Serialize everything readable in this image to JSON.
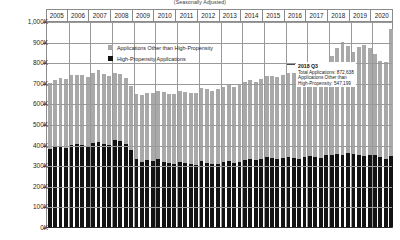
{
  "chart": {
    "subtitle": "(Seasonally Adjusted)",
    "type": "bar"
  },
  "legend": {
    "position": "inside-top-left",
    "items": [
      {
        "label": "Applications Other than High-Propensity",
        "color": "#a9a9a9",
        "swatch_name": "legend-swatch-other"
      },
      {
        "label": "High-Propensity Applications",
        "color": "#131313",
        "swatch_name": "legend-swatch-high"
      }
    ]
  },
  "annotation": {
    "header": "2018 Q3",
    "line1": "Total Applications: 872,638",
    "line2": "Applications Other than",
    "line3": "High-Propensity: 547,199"
  },
  "chart_data": {
    "type": "bar",
    "stacked": true,
    "title": "",
    "subtitle": "(Seasonally Adjusted)",
    "xlabel": "",
    "ylabel": "",
    "ylim": [
      0,
      1000000
    ],
    "grid": true,
    "ytick_labels": [
      "1,000K",
      "900K",
      "800K",
      "700K",
      "600K",
      "500K",
      "400K",
      "300K",
      "200K",
      "100K",
      "0K"
    ],
    "ytick_values": [
      1000000,
      900000,
      800000,
      700000,
      600000,
      500000,
      400000,
      300000,
      200000,
      100000,
      0
    ],
    "year_labels": [
      "2005",
      "2006",
      "2007",
      "2008",
      "2009",
      "2010",
      "2011",
      "2012",
      "2013",
      "2014",
      "2015",
      "2016",
      "2017",
      "2018",
      "2019",
      "2020"
    ],
    "x_unit": "quarter",
    "series": [
      {
        "name": "High-Propensity Applications",
        "color": "#131313",
        "values": [
          380000,
          388000,
          392000,
          385000,
          398000,
          404000,
          399000,
          392000,
          408000,
          414000,
          405000,
          396000,
          420000,
          418000,
          404000,
          372000,
          330000,
          318000,
          324000,
          320000,
          328000,
          316000,
          310000,
          306000,
          318000,
          312000,
          306000,
          300000,
          322000,
          310000,
          304000,
          308000,
          316000,
          320000,
          312000,
          318000,
          326000,
          330000,
          324000,
          330000,
          338000,
          334000,
          330000,
          336000,
          340000,
          336000,
          330000,
          340000,
          344000,
          342000,
          336000,
          348000,
          352000,
          356000,
          350000,
          358000,
          354000,
          350000,
          344000,
          352000,
          350000,
          338000,
          330000,
          344000
        ]
      },
      {
        "name": "Applications Other than High-Propensity",
        "color": "#a9a9a9",
        "values": [
          320000,
          328000,
          330000,
          334000,
          338000,
          336000,
          340000,
          338000,
          342000,
          346000,
          340000,
          336000,
          330000,
          326000,
          320000,
          312000,
          318000,
          322000,
          326000,
          330000,
          334000,
          338000,
          336000,
          340000,
          344000,
          342000,
          346000,
          350000,
          354000,
          358000,
          356000,
          360000,
          366000,
          370000,
          368000,
          374000,
          380000,
          384000,
          382000,
          388000,
          394000,
          398000,
          396000,
          402000,
          408000,
          412000,
          410000,
          418000,
          424000,
          430000,
          436000,
          444000,
          478000,
          512000,
          547199,
          520000,
          498000,
          526000,
          540000,
          516000,
          492000,
          470000,
          470000,
          616000
        ]
      }
    ],
    "highlight": {
      "label": "2018 Q3",
      "total_applications": 872638,
      "applications_other_than_high_propensity": 547199
    }
  }
}
